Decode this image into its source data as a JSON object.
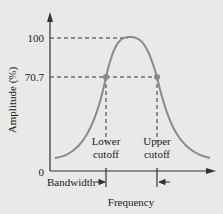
{
  "diagram": {
    "type": "bandpass-frequency-response",
    "y_axis": {
      "label": "Amplitude (%)",
      "ticks": [
        {
          "value": "100"
        },
        {
          "value": "70.7"
        },
        {
          "value": "0"
        }
      ]
    },
    "x_axis": {
      "label": "Frequency"
    },
    "cutoffs": {
      "lower": {
        "line1": "Lower",
        "line2": "cutoff"
      },
      "upper": {
        "line1": "Upper",
        "line2": "cutoff"
      }
    },
    "bandwidth_label": "Bandwidth",
    "colors": {
      "background": "#e9e9e8",
      "axis": "#333333",
      "curve": "#8a8a8a",
      "dashed": "#333333",
      "marker": "#8a8a8a"
    }
  }
}
